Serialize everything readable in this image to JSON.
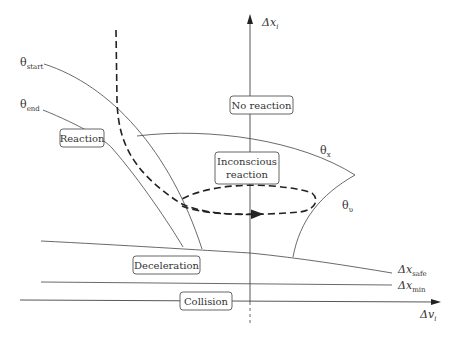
{
  "axes": {
    "y_label": "Δx",
    "y_sub": "i",
    "x_label": "Δv",
    "x_sub": "i"
  },
  "curve_labels": {
    "theta_start": {
      "main": "θ",
      "sub": "start"
    },
    "theta_end": {
      "main": "θ",
      "sub": "end"
    },
    "theta_x": {
      "main": "θ",
      "sub": "x"
    },
    "theta_v": {
      "main": "θ",
      "sub": "υ"
    },
    "dx_safe": {
      "main": "Δx",
      "sub": "safe"
    },
    "dx_min": {
      "main": "Δx",
      "sub": "min"
    }
  },
  "regions": {
    "no_reaction": "No reaction",
    "reaction": "Reaction",
    "inconscious_line1": "Inconscious",
    "inconscious_line2": "reaction",
    "deceleration": "Deceleration",
    "collision": "Collision"
  },
  "colors": {
    "stroke": "#444444",
    "text": "#333333",
    "background": "#ffffff"
  }
}
